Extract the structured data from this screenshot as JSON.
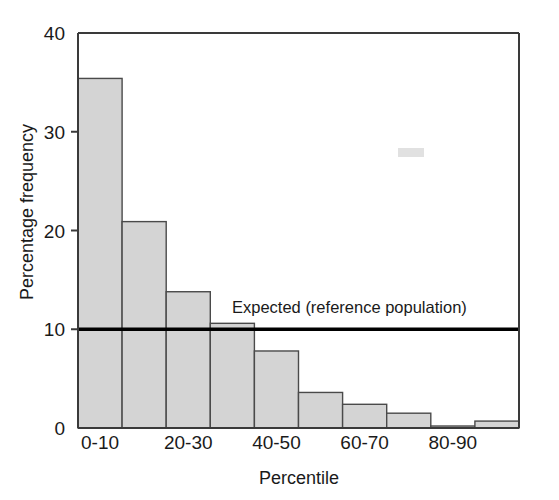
{
  "chart_data": {
    "type": "bar",
    "title": "",
    "subtitle": "",
    "xlabel": "Percentile",
    "ylabel": "Percentage frequency",
    "categories": [
      "0-10",
      "10-20",
      "20-30",
      "30-40",
      "40-50",
      "50-60",
      "60-70",
      "70-80",
      "80-90",
      "90-100"
    ],
    "values": [
      35.4,
      20.9,
      13.8,
      10.6,
      7.8,
      3.6,
      2.4,
      1.5,
      0.2,
      0.7
    ],
    "xtick_labels": [
      "0-10",
      "20-30",
      "40-50",
      "60-70",
      "80-90"
    ],
    "xtick_categories": [
      "0-10",
      "20-30",
      "40-50",
      "60-70",
      "80-90"
    ],
    "ytick_labels": [
      "0",
      "10",
      "20",
      "30",
      "40"
    ],
    "ytick_values": [
      0,
      10,
      20,
      30,
      40
    ],
    "ylim": [
      0,
      40
    ],
    "grid": "off",
    "legend_position": "inside-right",
    "annotations": [
      {
        "name": "expected-reference-line",
        "label": "Expected (reference population)",
        "value": 10,
        "color": "#000000"
      }
    ],
    "series": [
      {
        "name": "Observed percentage frequency",
        "color": "#d4d4d4",
        "edge_color": "#4a4a4a",
        "values": [
          35.4,
          20.9,
          13.8,
          10.6,
          7.8,
          3.6,
          2.4,
          1.5,
          0.2,
          0.7
        ]
      }
    ]
  },
  "axes": {
    "y_title": "Percentage frequency",
    "x_title": "Percentile"
  },
  "reference": {
    "label": "Expected (reference population)"
  }
}
